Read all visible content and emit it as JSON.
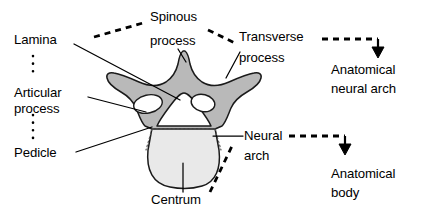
{
  "figure": {
    "colors": {
      "neural_arch_fill": "#b9b9b9",
      "body_fill": "#e9e9e9",
      "foramen_fill": "#ffffff",
      "outline": "#1a1a1a",
      "text": "#000000"
    }
  },
  "labels": {
    "lamina": "Lamina",
    "articular_process_line1": "Articular",
    "articular_process_line2": "process",
    "pedicle": "Pedicle",
    "spinous_process_line1": "Spinous",
    "spinous_process_line2": "process",
    "transverse_process_line1": "Transverse",
    "transverse_process_line2": "process",
    "neural_arch_line1": "Neural",
    "neural_arch_line2": "arch",
    "centrum": "Centrum",
    "anatomical_neural_arch_line1": "Anatomical",
    "anatomical_neural_arch_line2": "neural arch",
    "anatomical_body_line1": "Anatomical",
    "anatomical_body_line2": "body"
  },
  "groups": [
    {
      "name": "anatomical-neural-arch",
      "result": "Anatomical neural arch",
      "members": [
        "Lamina",
        "Articular process",
        "Pedicle",
        "Spinous process",
        "Transverse process"
      ]
    },
    {
      "name": "anatomical-body",
      "result": "Anatomical body",
      "members": [
        "Neural arch",
        "Centrum"
      ]
    }
  ],
  "structures": [
    "spinous process",
    "transverse process",
    "lamina",
    "articular process",
    "pedicle",
    "vertebral foramen",
    "centrum",
    "neural arch"
  ]
}
